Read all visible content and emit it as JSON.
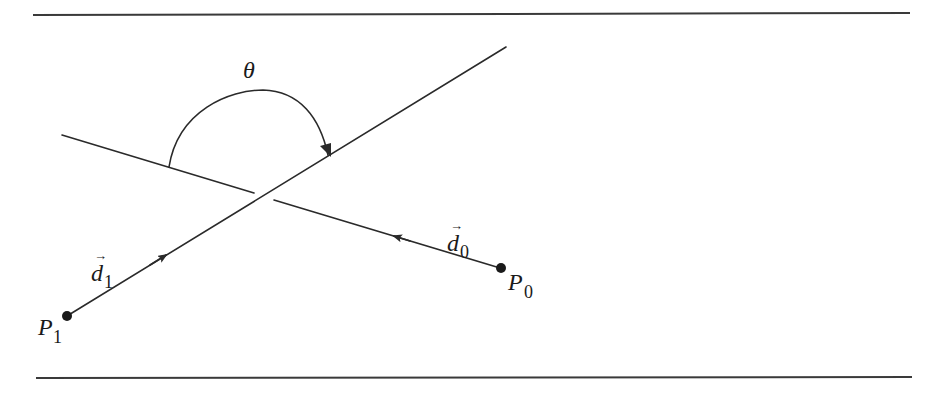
{
  "diagram": {
    "title": "",
    "angle_label": "θ",
    "points": [
      {
        "id": "P0",
        "label": "P",
        "subscript": "0"
      },
      {
        "id": "P1",
        "label": "P",
        "subscript": "1"
      }
    ],
    "vectors": [
      {
        "id": "d0",
        "label": "d",
        "subscript": "0",
        "direction_from": "P0"
      },
      {
        "id": "d1",
        "label": "d",
        "subscript": "1",
        "direction_from": "P1"
      }
    ],
    "vector_arrow": "→",
    "colors": {
      "ink": "#2a2a2a",
      "background": "#ffffff"
    }
  }
}
